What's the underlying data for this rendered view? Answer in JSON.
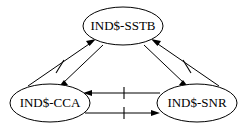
{
  "diagram": {
    "type": "directed-graph",
    "background_color": "#ffffff",
    "stroke_color": "#000000",
    "font_style": "serif",
    "nodes": [
      {
        "id": "sstb",
        "label": "IND$-SSTB",
        "shape": "ellipse",
        "cx": 123,
        "cy": 26,
        "rx": 40,
        "ry": 19
      },
      {
        "id": "cca",
        "label": "IND$-CCA",
        "shape": "ellipse",
        "cx": 50,
        "cy": 103,
        "rx": 40,
        "ry": 19
      },
      {
        "id": "snr",
        "label": "IND$-SNR",
        "shape": "ellipse",
        "cx": 197,
        "cy": 103,
        "rx": 40,
        "ry": 19
      }
    ],
    "edges": [
      {
        "id": "cca-to-sstb",
        "from": "IND$-CCA",
        "to": "IND$-SSTB",
        "direction": "up-right",
        "tick_mark": true
      },
      {
        "id": "sstb-to-cca",
        "from": "IND$-SSTB",
        "to": "IND$-CCA",
        "direction": "down-left",
        "tick_mark": false
      },
      {
        "id": "snr-to-sstb",
        "from": "IND$-SNR",
        "to": "IND$-SSTB",
        "direction": "up-left",
        "tick_mark": true
      },
      {
        "id": "sstb-to-snr",
        "from": "IND$-SSTB",
        "to": "IND$-SNR",
        "direction": "down-right",
        "tick_mark": false
      },
      {
        "id": "snr-to-cca",
        "from": "IND$-SNR",
        "to": "IND$-CCA",
        "direction": "left",
        "tick_mark": true
      },
      {
        "id": "cca-to-snr",
        "from": "IND$-CCA",
        "to": "IND$-SNR",
        "direction": "right",
        "tick_mark": true
      }
    ]
  }
}
